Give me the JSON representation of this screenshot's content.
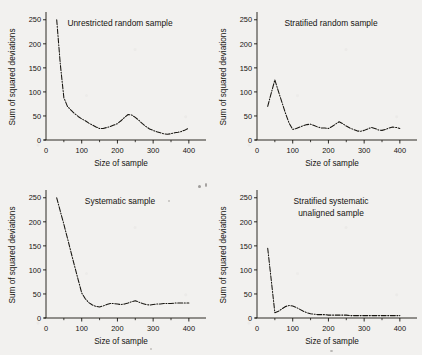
{
  "figure": {
    "background_color": "#f2f1ef",
    "ink_color": "#16140f",
    "panel_count": 4
  },
  "axes_common": {
    "ylabel": "Sum of squared deviations",
    "xlabel": "Size of  sample",
    "ytick_labels": [
      "0",
      "50",
      "100",
      "150",
      "200",
      "250"
    ],
    "ytick_values": [
      0,
      50,
      100,
      150,
      200,
      250
    ],
    "xtick_labels": [
      "0",
      "100",
      "200",
      "300",
      "400"
    ],
    "xtick_values": [
      0,
      100,
      200,
      300,
      400
    ],
    "xminor_values": [
      50,
      150,
      250,
      350
    ],
    "xlim": [
      0,
      420
    ],
    "ylim": [
      0,
      262
    ],
    "grid": "off",
    "legend": "none",
    "line_style": "dash-dot",
    "line_color": "#16140f"
  },
  "chart_data": [
    {
      "type": "line",
      "panel": "top-left",
      "title": "Unrestricted random sample",
      "xlabel": "Size of  sample",
      "ylabel": "Sum of squared deviations",
      "xlim": [
        0,
        420
      ],
      "ylim": [
        0,
        262
      ],
      "grid": "off",
      "legend": "none",
      "x": [
        30,
        40,
        50,
        60,
        70,
        80,
        90,
        100,
        110,
        120,
        130,
        140,
        150,
        160,
        170,
        180,
        190,
        200,
        210,
        220,
        230,
        240,
        250,
        260,
        270,
        280,
        290,
        300,
        310,
        320,
        330,
        340,
        350,
        360,
        370,
        380,
        390,
        400
      ],
      "y": [
        250,
        158,
        88,
        70,
        62,
        55,
        49,
        44,
        40,
        35,
        31,
        27,
        24,
        24,
        26,
        28,
        31,
        34,
        40,
        47,
        53,
        52,
        47,
        41,
        34,
        28,
        23,
        20,
        17,
        15,
        13,
        12,
        13,
        15,
        16,
        18,
        21,
        25
      ]
    },
    {
      "type": "line",
      "panel": "top-right",
      "title": "Stratified random sample",
      "xlabel": "Size of  sample",
      "ylabel": "Sum of squared deviations",
      "xlim": [
        0,
        420
      ],
      "ylim": [
        0,
        262
      ],
      "grid": "off",
      "legend": "none",
      "x": [
        30,
        40,
        50,
        60,
        70,
        80,
        90,
        100,
        110,
        120,
        130,
        140,
        150,
        160,
        170,
        180,
        190,
        200,
        210,
        220,
        230,
        240,
        250,
        260,
        270,
        280,
        290,
        300,
        310,
        320,
        330,
        340,
        350,
        360,
        370,
        380,
        390,
        400
      ],
      "y": [
        70,
        98,
        125,
        101,
        78,
        55,
        35,
        22,
        24,
        27,
        30,
        32,
        33,
        30,
        27,
        25,
        25,
        24,
        28,
        33,
        38,
        34,
        29,
        25,
        22,
        19,
        18,
        20,
        23,
        26,
        24,
        21,
        20,
        22,
        25,
        27,
        26,
        24
      ]
    },
    {
      "type": "line",
      "panel": "bottom-left",
      "title": "Systematic sample",
      "xlabel": "Size of  sample",
      "ylabel": "Sum of squared deviations",
      "xlim": [
        0,
        420
      ],
      "ylim": [
        0,
        262
      ],
      "grid": "off",
      "legend": "none",
      "x": [
        30,
        40,
        50,
        60,
        70,
        80,
        90,
        100,
        110,
        120,
        130,
        140,
        150,
        160,
        170,
        180,
        190,
        200,
        210,
        220,
        230,
        240,
        250,
        260,
        270,
        280,
        290,
        300,
        310,
        320,
        330,
        340,
        350,
        360,
        370,
        380,
        390,
        400
      ],
      "y": [
        250,
        222,
        195,
        166,
        137,
        108,
        80,
        52,
        40,
        32,
        27,
        24,
        23,
        25,
        28,
        30,
        30,
        29,
        28,
        29,
        31,
        34,
        36,
        33,
        30,
        28,
        27,
        28,
        29,
        29,
        30,
        30,
        30,
        31,
        31,
        31,
        31,
        31
      ]
    },
    {
      "type": "line",
      "panel": "bottom-right",
      "title_lines": [
        "Stratified systematic",
        "unaligned sample"
      ],
      "title": "Stratified systematic unaligned sample",
      "xlabel": "Size of  sample",
      "ylabel": "Sum of squared deviations",
      "xlim": [
        0,
        420
      ],
      "ylim": [
        0,
        262
      ],
      "grid": "off",
      "legend": "none",
      "x": [
        30,
        40,
        50,
        60,
        70,
        80,
        90,
        100,
        110,
        120,
        130,
        140,
        150,
        160,
        170,
        180,
        190,
        200,
        210,
        220,
        230,
        240,
        250,
        260,
        270,
        280,
        290,
        300,
        310,
        320,
        330,
        340,
        350,
        360,
        370,
        380,
        390,
        400
      ],
      "y": [
        145,
        78,
        11,
        14,
        19,
        24,
        26,
        25,
        22,
        18,
        14,
        11,
        9,
        8,
        7,
        7,
        7,
        6,
        6,
        6,
        6,
        6,
        6,
        5,
        5,
        5,
        5,
        5,
        5,
        5,
        5,
        5,
        5,
        5,
        5,
        5,
        5,
        5
      ]
    }
  ]
}
